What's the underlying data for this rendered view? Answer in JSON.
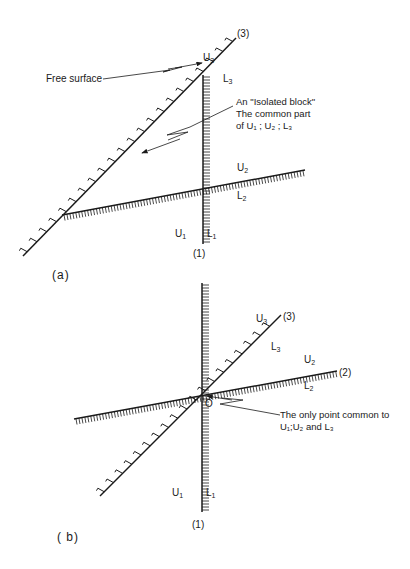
{
  "figure_a": {
    "caption": "(a)",
    "free_surface_label": "Free surface",
    "isolated_block_note": [
      "An \"Isolated block\"",
      "The common part",
      "of U₁ ; U₂ ; L₃"
    ],
    "lines": {
      "line1": {
        "id": "(1)",
        "upper": "U",
        "upper_sub": "1",
        "lower": "L",
        "lower_sub": "1"
      },
      "line2": {
        "upper": "U",
        "upper_sub": "2",
        "lower": "L",
        "lower_sub": "2"
      },
      "line3": {
        "id": "(3)",
        "upper": "U",
        "upper_sub": "3",
        "lower": "L",
        "lower_sub": "3"
      }
    }
  },
  "figure_b": {
    "caption": "( b)",
    "origin_label": "O",
    "point_note": [
      "The only point common to",
      "U₁;U₂ and L₃"
    ],
    "lines": {
      "line1": {
        "id": "(1)",
        "upper": "U",
        "upper_sub": "1",
        "lower": "L",
        "lower_sub": "1"
      },
      "line2": {
        "id": "(2)",
        "upper": "U",
        "upper_sub": "2",
        "lower": "L",
        "lower_sub": "2"
      },
      "line3": {
        "id": "(3)",
        "upper": "U",
        "upper_sub": "3",
        "lower": "L",
        "lower_sub": "3"
      }
    }
  },
  "colors": {
    "ink": "#1a1a1a",
    "background": "#ffffff"
  }
}
